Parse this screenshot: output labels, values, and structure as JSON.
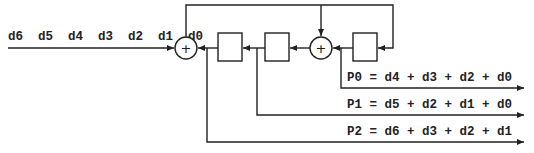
{
  "diagram": {
    "type": "convolutional-encoder / LFSR parity generator",
    "input_label": "d6  d5  d4  d3  d2  d1  d0",
    "adder_symbol": "+",
    "outputs": [
      {
        "name": "P0",
        "equation": "P0 = d4 + d3 + d2 + d0"
      },
      {
        "name": "P1",
        "equation": "P1 = d5 + d2 + d1 + d0"
      },
      {
        "name": "P2",
        "equation": "P2 = d6 + d3 + d2 + d1"
      }
    ],
    "components": {
      "adders": 2,
      "registers": 3
    },
    "colors": {
      "stroke": "#222222",
      "background": "#ffffff"
    }
  }
}
